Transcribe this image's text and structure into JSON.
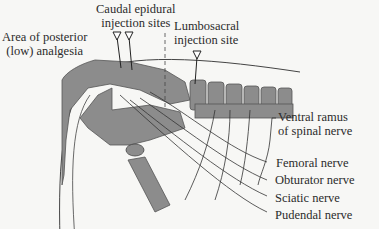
{
  "diagram": {
    "type": "anatomical illustration",
    "colors": {
      "bone": "#8c8c8c",
      "bone_outline": "#555555",
      "line": "#333333",
      "background": "#f7f7f5"
    },
    "labels": {
      "caudal_l1": "Caudal epidural",
      "caudal_l2": "injection sites",
      "area_l1": "Area of posterior",
      "area_l2": "(low) analgesia",
      "lumbo_l1": "Lumbosacral",
      "lumbo_l2": "injection site",
      "ventral_l1": "Ventral ramus",
      "ventral_l2": "of spinal nerve",
      "femoral": "Femoral nerve",
      "obturator": "Obturator nerve",
      "sciatic": "Sciatic nerve",
      "pudendal": "Pudendal nerve"
    }
  }
}
